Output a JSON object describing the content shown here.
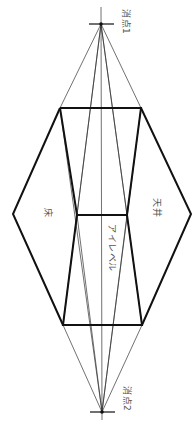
{
  "diagram": {
    "labels": {
      "vanishing_point_1": "消点1",
      "vanishing_point_2": "消点2",
      "floor": "床",
      "ceiling": "天井",
      "eye_level": "アイレベル"
    },
    "colors": {
      "background": "#ffffff",
      "stroke": "#111111",
      "thin_stroke": "#333333",
      "label": "#555555"
    },
    "points": {
      "vp1": [
        101,
        24
      ],
      "vp2": [
        102,
        412
      ],
      "top_left": [
        60,
        108
      ],
      "top_right": [
        141,
        108
      ],
      "mid_left": [
        77,
        215
      ],
      "mid_right": [
        127,
        215
      ],
      "bottom_left": [
        63,
        325
      ],
      "bottom_right": [
        142,
        325
      ],
      "hex_left": [
        13,
        214
      ],
      "hex_right": [
        191,
        214
      ]
    }
  }
}
